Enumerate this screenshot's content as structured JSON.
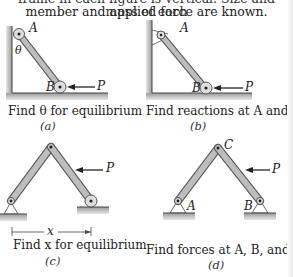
{
  "header": {
    "line1": "frame in each figure is vertical. Size and mass of each",
    "line2": "member and applied force are known."
  },
  "figures": [
    {
      "id": "a",
      "caption": "Find θ for equilibrium",
      "sublabel": "(a)",
      "labels": {
        "A": "A",
        "B": "B",
        "theta": "θ",
        "P": "P"
      }
    },
    {
      "id": "b",
      "caption": "Find reactions at A and B",
      "sublabel": "(b)",
      "labels": {
        "A": "A",
        "B": "B",
        "P": "P"
      }
    },
    {
      "id": "c",
      "caption": "Find x for equilibrium",
      "sublabel": "(c)",
      "labels": {
        "x": "x",
        "P": "P"
      }
    },
    {
      "id": "d",
      "caption": "Find forces at A, B, and C",
      "sublabel": "(d)",
      "labels": {
        "A": "A",
        "B": "B",
        "C": "C",
        "P": "P"
      }
    }
  ],
  "colors": {
    "member_fill": "#b9b9b9",
    "member_stroke": "#555555",
    "ground": "#a8a8a8",
    "text": "#222222"
  }
}
